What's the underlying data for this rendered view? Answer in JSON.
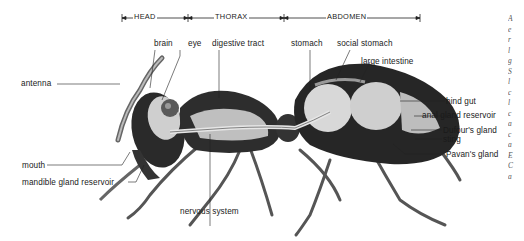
{
  "figure": {
    "body_regions": [
      {
        "id": "head",
        "label": "HEAD"
      },
      {
        "id": "thorax",
        "label": "THORAX"
      },
      {
        "id": "abdomen",
        "label": "ABDOMEN"
      }
    ],
    "labels": {
      "brain": "brain",
      "eye": "eye",
      "digestive_tract": "digestive tract",
      "stomach": "stomach",
      "social_stomach": "social stomach",
      "large_intestine": "large intestine",
      "antenna": "antenna",
      "hind_gut": "hind gut",
      "anal_gland_reservoir": "anal gland reservoir",
      "dufours_gland": "Dufour's gland",
      "sting": "sting",
      "pavans_gland": "Pavan's gland",
      "mouth": "mouth",
      "mandible_gland_reservoir": "mandible gland reservoir",
      "nervous_system": "nervous system"
    },
    "cropped_margin_text": [
      "A",
      "e",
      "r",
      "l",
      "g",
      "S",
      "l",
      "c",
      "l",
      "c",
      "a",
      "c",
      "a",
      "E",
      "C",
      "a"
    ]
  }
}
